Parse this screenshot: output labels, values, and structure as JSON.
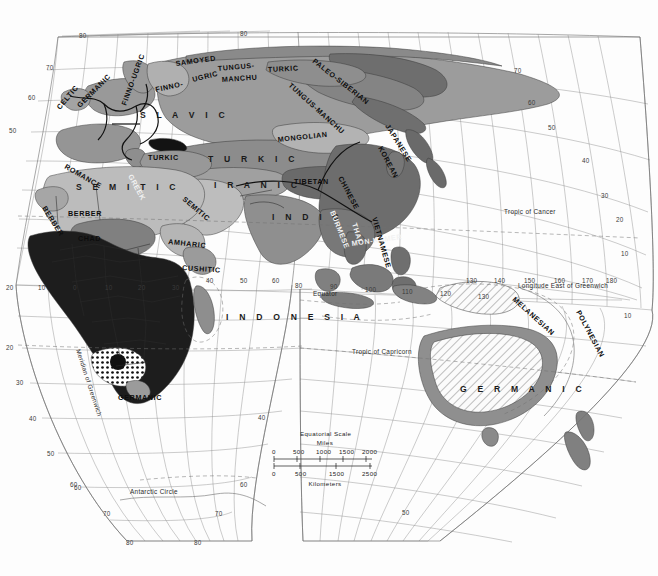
{
  "map": {
    "title": "World Language Families Map",
    "projection_note": "interrupted / sinusoidal-like eastern hemisphere projection",
    "reference_lines": [
      {
        "name": "tropic-of-cancer",
        "label": "Tropic of Cancer"
      },
      {
        "name": "tropic-of-capricorn",
        "label": "Tropic of Capricorn"
      },
      {
        "name": "equator",
        "label": "Equator"
      },
      {
        "name": "antarctic-circle",
        "label": "Antarctic Circle"
      },
      {
        "name": "meridian-of-greenwich",
        "label": "Meridian of Greenwich"
      },
      {
        "name": "longitude-east",
        "label": "Longitude East of Greenwich"
      }
    ],
    "scale_bar": {
      "title": "Equatorial Scale",
      "unit_top": "Miles",
      "unit_bottom": "Kilometers",
      "miles_ticks": [
        "0",
        "500",
        "1000",
        "1500",
        "2000"
      ],
      "km_ticks": [
        "0",
        "500",
        "1500",
        "2500"
      ]
    },
    "language_labels": [
      {
        "name": "celtic",
        "text": "CELTIC"
      },
      {
        "name": "germanic-europe",
        "text": "GERMANIC"
      },
      {
        "name": "romance",
        "text": "ROMANCE"
      },
      {
        "name": "finno-ugric",
        "text": "FINNO-UGRIC"
      },
      {
        "name": "finno",
        "text": "FINNO-"
      },
      {
        "name": "samoyed",
        "text": "SAMOYED"
      },
      {
        "name": "ugric",
        "text": "UGRIC"
      },
      {
        "name": "tungus",
        "text": "TUNGUS-"
      },
      {
        "name": "manchu",
        "text": "MANCHU"
      },
      {
        "name": "tungus-manchu",
        "text": "TUNGUS-MANCHU"
      },
      {
        "name": "turkic-north",
        "text": "TURKIC"
      },
      {
        "name": "paleo-siberian",
        "text": "PALEO-SIBERIAN"
      },
      {
        "name": "slavic",
        "text": "S L A V I C"
      },
      {
        "name": "mongolian",
        "text": "MONGOLIAN"
      },
      {
        "name": "japanese",
        "text": "JAPANESE"
      },
      {
        "name": "korean",
        "text": "KOREAN"
      },
      {
        "name": "turkic-anatolia",
        "text": "TURKIC"
      },
      {
        "name": "turkic-central",
        "text": "T U R K I C"
      },
      {
        "name": "greek",
        "text": "GREEK"
      },
      {
        "name": "iranic",
        "text": "I R A N I C"
      },
      {
        "name": "tibetan",
        "text": "TIBETAN"
      },
      {
        "name": "chinese",
        "text": "CHINESE"
      },
      {
        "name": "semitic-nafrica",
        "text": "S E M I T I C"
      },
      {
        "name": "semitic-arabia",
        "text": "SEMITIC"
      },
      {
        "name": "berber-west",
        "text": "BERBER"
      },
      {
        "name": "berber-main",
        "text": "BERBER"
      },
      {
        "name": "chad",
        "text": "CHAD"
      },
      {
        "name": "amharic",
        "text": "AMHARIC"
      },
      {
        "name": "cushitic",
        "text": "CUSHITIC"
      },
      {
        "name": "indic",
        "text": "I N D I C"
      },
      {
        "name": "burmese",
        "text": "BURMESE"
      },
      {
        "name": "thai",
        "text": "THAI"
      },
      {
        "name": "mon-khmer",
        "text": "MON-KHMER"
      },
      {
        "name": "vietnamese",
        "text": "VIETNAMESE"
      },
      {
        "name": "germanic-safrica",
        "text": "GERMANIC"
      },
      {
        "name": "germanic-australia",
        "text": "G E R M A N I C"
      },
      {
        "name": "melanesian",
        "text": "MELANESIAN"
      },
      {
        "name": "polynesian",
        "text": "POLYNESIAN"
      },
      {
        "name": "indonesian-ocean",
        "text": "I N D O N E S I A"
      }
    ],
    "graticule_labels": {
      "top": [
        "80",
        "80"
      ],
      "left": [
        "70",
        "60",
        "50",
        "20",
        "10",
        "0",
        "20",
        "30",
        "40",
        "50",
        "60"
      ],
      "right": [
        "70",
        "60",
        "50",
        "40",
        "30",
        "20",
        "10",
        "10"
      ],
      "bottom": [
        "60",
        "70",
        "80",
        "80",
        "70",
        "60",
        "50",
        "40"
      ],
      "equator_row": [
        "20",
        "10",
        "0",
        "10",
        "20",
        "30",
        "40",
        "50",
        "60",
        "70",
        "80",
        "90",
        "100",
        "110",
        "120",
        "130",
        "140",
        "150",
        "160",
        "170",
        "180"
      ],
      "australia_row": [
        "130",
        "140",
        "150",
        "160",
        "170",
        "180"
      ]
    }
  }
}
